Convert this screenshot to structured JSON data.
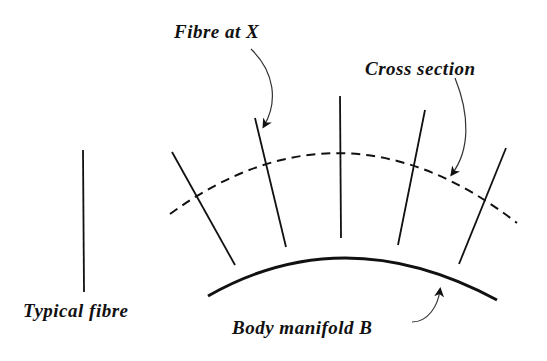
{
  "labels": {
    "fibre_at_x": "Fibre at X",
    "cross_section": "Cross section",
    "typical_fibre": "Typical fibre",
    "body_manifold": "Body manifold B"
  },
  "colors": {
    "ink": "#111111",
    "background": "#ffffff"
  },
  "diagram": {
    "typical_fibre": {
      "x1": 83,
      "y1": 150,
      "x2": 84,
      "y2": 292
    },
    "fibres": [
      {
        "x1": 172,
        "y1": 152,
        "x2": 235,
        "y2": 265
      },
      {
        "x1": 255,
        "y1": 118,
        "x2": 286,
        "y2": 247
      },
      {
        "x1": 340,
        "y1": 96,
        "x2": 341,
        "y2": 238
      },
      {
        "x1": 425,
        "y1": 110,
        "x2": 398,
        "y2": 245
      },
      {
        "x1": 506,
        "y1": 148,
        "x2": 459,
        "y2": 264
      }
    ]
  }
}
